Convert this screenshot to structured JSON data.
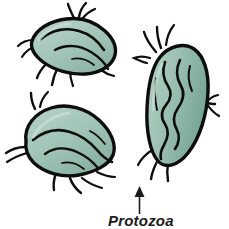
{
  "figure": {
    "kind": "biology-illustration",
    "subject": "Protozoa",
    "background_color": "#ffffff",
    "organism_count": 3
  },
  "annotation": {
    "label": "Protozoa",
    "arrow_name": "leader-arrow",
    "arrow_direction": "up",
    "arrow_color": "#1b1b1b"
  },
  "palette": {
    "body_fill_light": "#a9c9bd",
    "body_fill_mid": "#92b9ab",
    "body_fill_dark": "#79a89a",
    "body_highlight": "#bcd6cb",
    "outline": "#0d0d0d",
    "background": "#ffffff"
  },
  "organisms": [
    {
      "name": "protozoan-top-left",
      "position": "top-left",
      "orientation": "diagonal",
      "flagella_count": 9
    },
    {
      "name": "protozoan-right",
      "position": "right",
      "orientation": "vertical",
      "flagella_count": 8
    },
    {
      "name": "protozoan-bottom-left",
      "position": "bottom-left",
      "orientation": "diagonal",
      "flagella_count": 8
    }
  ]
}
